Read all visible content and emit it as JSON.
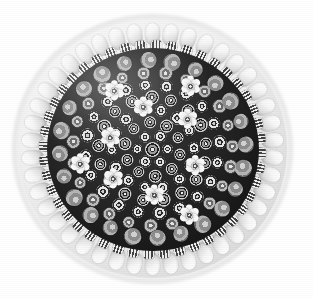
{
  "artwork": {
    "subject": "millefiori-glass-paperweight",
    "title": "Close-packed concentric millefiori paperweight",
    "medium": "Black-and-white photograph",
    "view": "top-down",
    "background_color": "#ffffff",
    "palette": {
      "background": "#ffffff",
      "halo": "#9a9a9a",
      "dome_glass": "#efefef",
      "dome_edge": "#bdbdbd",
      "ground_dark": "#1e1e1e",
      "cane_white": "#ffffff",
      "cane_light_gray": "#d2d2d2",
      "cane_mid_gray": "#8d8d8d",
      "cane_dark": "#2b2b2b"
    },
    "geometry": {
      "image_width": 313,
      "image_height": 298,
      "center_x": 152,
      "center_y": 149,
      "dome_radius": 135,
      "halo_radius": 145,
      "ground_radius": 106
    },
    "structure": [
      {
        "layer": "outer-halo",
        "description": "soft gray shadow rim around glass dome"
      },
      {
        "layer": "glass-dome",
        "description": "clear glass dome with highlight upper-left"
      },
      {
        "layer": "barrel-cane-ring",
        "description": "ring of white oval barrel canes",
        "count": 42
      },
      {
        "layer": "rod-cane-ring",
        "description": "ring of radiating black-and-white striped rod canes",
        "count": 44
      },
      {
        "layer": "cluster-ring",
        "description": "ring of large gray cluster canes on dark ground",
        "count": 18
      },
      {
        "layer": "flower-ring",
        "description": "scattered large white six-petal flower canes",
        "count": 10
      },
      {
        "layer": "star-field",
        "description": "concentric rings of small star and cog canes",
        "count": 96
      },
      {
        "layer": "center-cane",
        "description": "single central cog cane"
      }
    ]
  },
  "rings": [
    {
      "name": "ring-1",
      "radius": 15,
      "count": 6,
      "cane_type": "star",
      "size": 11
    },
    {
      "name": "ring-2",
      "radius": 28,
      "count": 10,
      "cane_type": "cog",
      "size": 12
    },
    {
      "name": "ring-3",
      "radius": 41,
      "count": 14,
      "cane_type": "star",
      "size": 12
    },
    {
      "name": "ring-4",
      "radius": 54,
      "count": 17,
      "cane_type": "cog",
      "size": 13
    },
    {
      "name": "ring-5",
      "radius": 67,
      "count": 20,
      "cane_type": "star",
      "size": 13
    },
    {
      "name": "ring-6",
      "radius": 80,
      "count": 23,
      "cane_type": "gray",
      "size": 13
    },
    {
      "name": "ring-7",
      "radius": 93,
      "count": 24,
      "cane_type": "cluster",
      "size": 16
    }
  ],
  "flower_canes": [
    {
      "radius": 44,
      "angle": 196
    },
    {
      "radius": 45,
      "angle": 258
    },
    {
      "radius": 47,
      "angle": 318
    },
    {
      "radius": 46,
      "angle": 22
    },
    {
      "radius": 48,
      "angle": 88
    },
    {
      "radius": 50,
      "angle": 142
    },
    {
      "radius": 74,
      "angle": 168
    },
    {
      "radius": 76,
      "angle": 300
    },
    {
      "radius": 78,
      "angle": 62
    },
    {
      "radius": 72,
      "angle": 238
    }
  ],
  "barrel_ring": {
    "count": 42,
    "radius": 120
  },
  "rod_ring": {
    "count": 44,
    "radius": 103
  },
  "caption": ""
}
